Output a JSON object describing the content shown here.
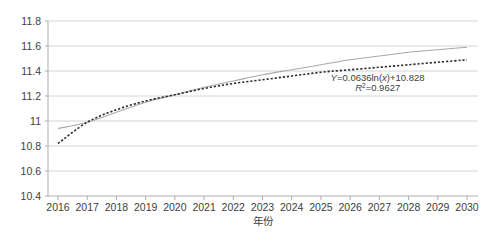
{
  "chart_data": {
    "type": "line",
    "title": "",
    "xlabel": "年份",
    "ylabel": "",
    "grid": true,
    "legend": "none",
    "xlim": [
      2016,
      2030
    ],
    "ylim": [
      10.4,
      11.8
    ],
    "ytick_step": 0.2,
    "categories": [
      2016,
      2017,
      2018,
      2019,
      2020,
      2021,
      2022,
      2023,
      2024,
      2025,
      2026,
      2027,
      2028,
      2029,
      2030
    ],
    "xtick_labels": [
      "2016",
      "2017",
      "2018",
      "2019",
      "2020",
      "2021",
      "2022",
      "2023",
      "2024",
      "2025",
      "2026",
      "2027",
      "2028",
      "2029",
      "2030"
    ],
    "ytick_labels": [
      "10.4",
      "10.6",
      "10.8",
      "11",
      "11.2",
      "11.4",
      "11.6",
      "11.8"
    ],
    "ytick_values": [
      10.4,
      10.6,
      10.8,
      11.0,
      11.2,
      11.4,
      11.6,
      11.8
    ],
    "series": [
      {
        "name": "实际值",
        "style": "solid",
        "color": "#a9a9a9",
        "values": [
          10.94,
          10.99,
          11.07,
          11.15,
          11.21,
          11.27,
          11.32,
          11.37,
          11.41,
          11.45,
          11.49,
          11.52,
          11.55,
          11.57,
          11.59
        ]
      },
      {
        "name": "对数趋势线",
        "style": "dotted",
        "color": "#2b2b2b",
        "values": [
          10.82,
          10.99,
          11.09,
          11.16,
          11.21,
          11.26,
          11.3,
          11.33,
          11.36,
          11.39,
          11.41,
          11.43,
          11.45,
          11.47,
          11.49
        ]
      }
    ],
    "annotations": [
      {
        "id": "equation",
        "text": "Y=0.0636ln(x)+10.828",
        "x": 2025.2,
        "y": 11.32
      },
      {
        "id": "r-squared",
        "text": "R2=0.9627",
        "x": 2026.0,
        "y": 11.24
      }
    ]
  },
  "annotation_parts": {
    "eq_y": "Y",
    "eq_body": "=0.0636ln(",
    "eq_x": "x",
    "eq_tail": ")+10.828",
    "r_symbol": "R",
    "r_exp": "2",
    "r_value": "=0.9627"
  },
  "colors": {
    "background": "#ffffff",
    "grid": "#c9c9c9",
    "axis": "#a6a6a6",
    "text": "#3d3d3d",
    "series_solid": "#a9a9a9",
    "series_dotted": "#2b2b2b"
  }
}
